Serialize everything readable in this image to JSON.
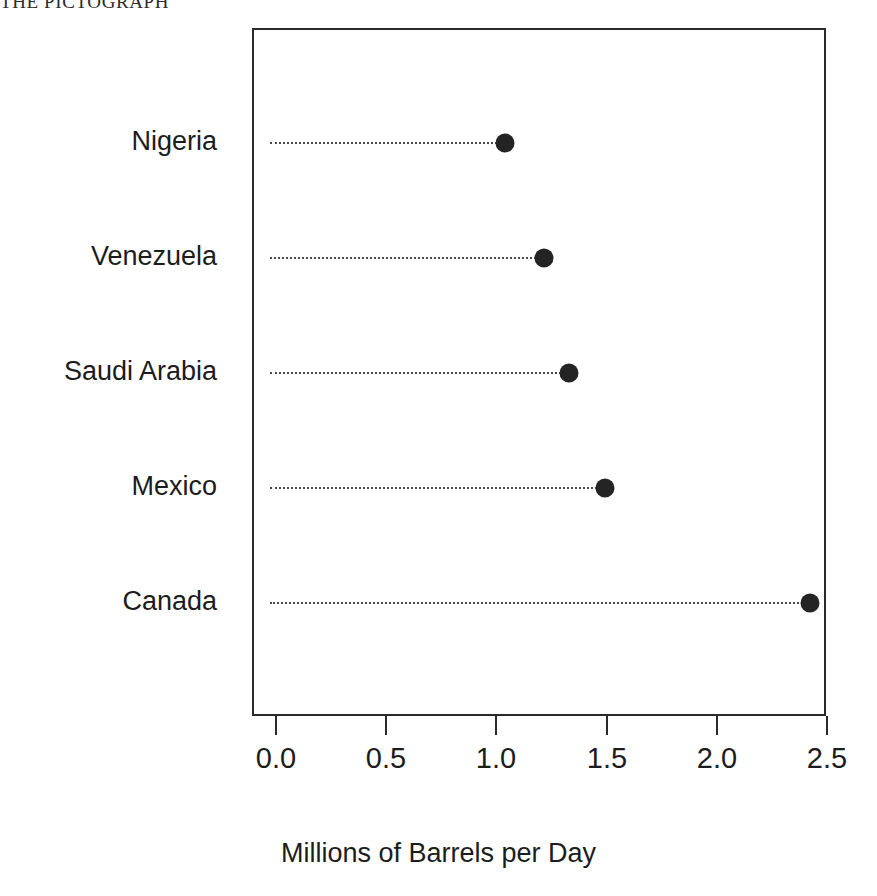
{
  "figure": {
    "heading": "THE PICTOGRAPH"
  },
  "chart_data": {
    "type": "scatter",
    "subtype": "cleveland-dot-plot",
    "title": "",
    "xlabel": "Millions of Barrels per Day",
    "ylabel": "",
    "categories": [
      "Canada",
      "Mexico",
      "Saudi Arabia",
      "Venezuela",
      "Nigeria"
    ],
    "values": [
      2.44,
      1.54,
      1.38,
      1.27,
      1.1
    ],
    "series": [
      {
        "name": "Millions of Barrels per Day",
        "points": [
          {
            "category": "Nigeria",
            "value": 1.1
          },
          {
            "category": "Venezuela",
            "value": 1.27
          },
          {
            "category": "Saudi Arabia",
            "value": 1.38
          },
          {
            "category": "Mexico",
            "value": 1.54
          },
          {
            "category": "Canada",
            "value": 2.44
          }
        ]
      }
    ],
    "display_order_top_to_bottom": [
      "Nigeria",
      "Venezuela",
      "Saudi Arabia",
      "Mexico",
      "Canada"
    ],
    "xlim": [
      0.0,
      2.5
    ],
    "xticks": [
      0.0,
      0.5,
      1.0,
      1.5,
      2.0,
      2.5
    ],
    "xtick_labels": [
      "0.0",
      "0.5",
      "1.0",
      "1.5",
      "2.0",
      "2.5"
    ],
    "grid": false,
    "legend": false,
    "legend_position": "none",
    "marker": "filled-circle",
    "leader_line_style": "dotted",
    "colors": {
      "marker": "#242424",
      "leader_line": "#4a4a4a",
      "axis": "#2a2a2a",
      "text": "#1c1c1c",
      "background": "#ffffff"
    }
  }
}
